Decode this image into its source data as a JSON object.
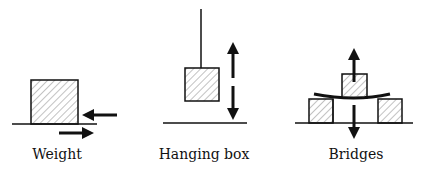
{
  "diagram": {
    "panels": [
      {
        "id": "weight",
        "label": "Weight"
      },
      {
        "id": "hanging-box",
        "label": "Hanging box"
      },
      {
        "id": "bridges",
        "label": "Bridges"
      }
    ],
    "colors": {
      "stroke": "#111111",
      "hatch": "#555555",
      "background": "#ffffff"
    }
  }
}
